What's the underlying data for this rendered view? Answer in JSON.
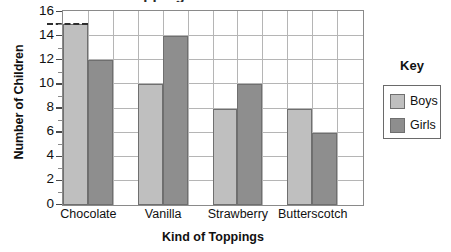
{
  "chart_data": {
    "type": "bar",
    "title": "Toppings on Ice Cream",
    "xlabel": "Kind of Toppings",
    "ylabel": "Number of Children",
    "categories": [
      "Chocolate",
      "Vanilla",
      "Strawberry",
      "Butterscotch"
    ],
    "series": [
      {
        "name": "Boys",
        "color": "#bfbfbf",
        "values": [
          15,
          10,
          8,
          8
        ]
      },
      {
        "name": "Girls",
        "color": "#8e8e8e",
        "values": [
          12,
          14,
          10,
          6
        ]
      }
    ],
    "ylim": [
      0,
      16
    ],
    "ytick_step": 2,
    "yticks": [
      "0",
      "2",
      "4",
      "6",
      "8",
      "10",
      "12",
      "14",
      "16"
    ],
    "grid": true,
    "legend_position": "right",
    "annotations": [
      {
        "type": "dashed-guide",
        "value": 15,
        "target": "Chocolate / Boys"
      }
    ]
  },
  "legend": {
    "title": "Key",
    "entries": [
      {
        "label": "Boys",
        "swatch": "boys"
      },
      {
        "label": "Girls",
        "swatch": "girls"
      }
    ]
  }
}
